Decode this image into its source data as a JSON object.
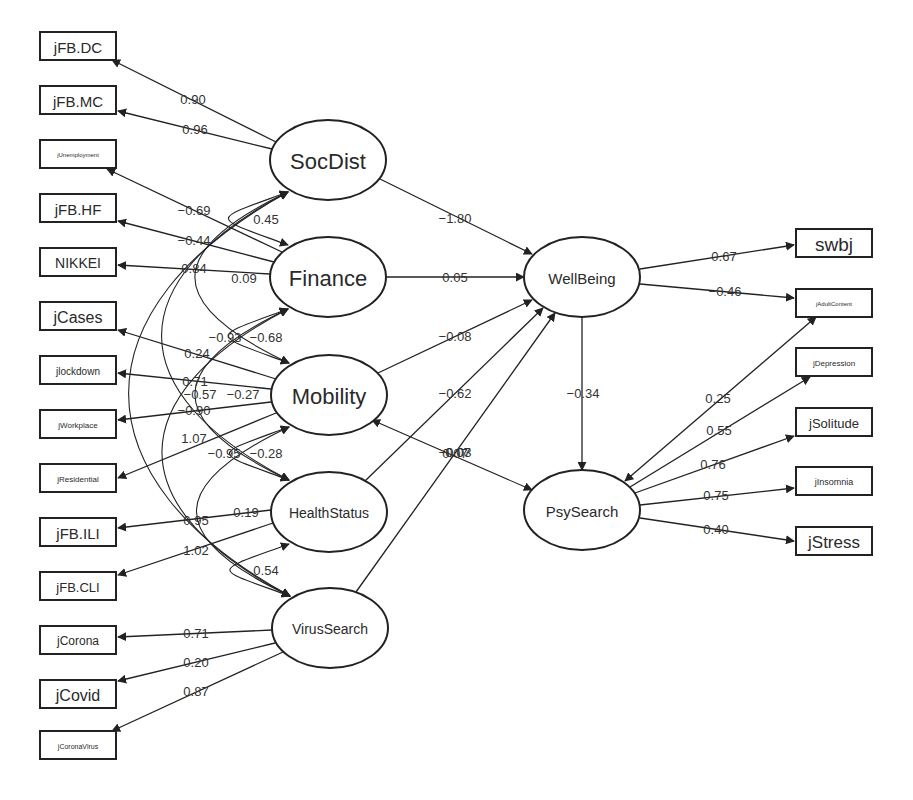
{
  "diagram": {
    "type": "structural-equation-model",
    "line_color": "#222222",
    "background": "#ffffff",
    "latent_variables": [
      {
        "id": "SocDist",
        "label": "SocDist",
        "cx": 328,
        "cy": 160,
        "rx": 58,
        "ry": 40,
        "font_size": 22
      },
      {
        "id": "Finance",
        "label": "Finance",
        "cx": 328,
        "cy": 277,
        "rx": 58,
        "ry": 40,
        "font_size": 22
      },
      {
        "id": "Mobility",
        "label": "Mobility",
        "cx": 329,
        "cy": 395,
        "rx": 58,
        "ry": 40,
        "font_size": 22
      },
      {
        "id": "HealthStatus",
        "label": "HealthStatus",
        "cx": 329,
        "cy": 512,
        "rx": 58,
        "ry": 40,
        "font_size": 14
      },
      {
        "id": "VirusSearch",
        "label": "VirusSearch",
        "cx": 330,
        "cy": 628,
        "rx": 58,
        "ry": 40,
        "font_size": 14
      },
      {
        "id": "WellBeing",
        "label": "WellBeing",
        "cx": 582,
        "cy": 277,
        "rx": 58,
        "ry": 40,
        "font_size": 15
      },
      {
        "id": "PsySearch",
        "label": "PsySearch",
        "cx": 582,
        "cy": 510,
        "rx": 58,
        "ry": 40,
        "font_size": 15
      }
    ],
    "observed_variables": [
      {
        "id": "jFB.DC",
        "label": "jFB.DC",
        "x": 40,
        "y": 32,
        "w": 76,
        "h": 28,
        "font_size": 15
      },
      {
        "id": "jFB.MC",
        "label": "jFB.MC",
        "x": 40,
        "y": 86,
        "w": 76,
        "h": 28,
        "font_size": 15
      },
      {
        "id": "jUnemployment",
        "label": "jUnemployment",
        "x": 40,
        "y": 140,
        "w": 76,
        "h": 28,
        "font_size": 6
      },
      {
        "id": "jFB.HF",
        "label": "jFB.HF",
        "x": 40,
        "y": 194,
        "w": 76,
        "h": 28,
        "font_size": 15
      },
      {
        "id": "NIKKEI",
        "label": "NIKKEI",
        "x": 40,
        "y": 248,
        "w": 76,
        "h": 28,
        "font_size": 14
      },
      {
        "id": "jCases",
        "label": "jCases",
        "x": 40,
        "y": 302,
        "w": 76,
        "h": 28,
        "font_size": 16
      },
      {
        "id": "jlockdown",
        "label": "jlockdown",
        "x": 40,
        "y": 356,
        "w": 76,
        "h": 28,
        "font_size": 10
      },
      {
        "id": "jWorkplace",
        "label": "jWorkplace",
        "x": 40,
        "y": 410,
        "w": 76,
        "h": 28,
        "font_size": 8
      },
      {
        "id": "jResidential",
        "label": "jResidential",
        "x": 40,
        "y": 464,
        "w": 76,
        "h": 28,
        "font_size": 8
      },
      {
        "id": "jFB.ILI",
        "label": "jFB.ILI",
        "x": 40,
        "y": 518,
        "w": 76,
        "h": 28,
        "font_size": 15
      },
      {
        "id": "jFB.CLI",
        "label": "jFB.CLI",
        "x": 40,
        "y": 572,
        "w": 76,
        "h": 28,
        "font_size": 13
      },
      {
        "id": "jCorona",
        "label": "jCorona",
        "x": 40,
        "y": 626,
        "w": 76,
        "h": 28,
        "font_size": 12
      },
      {
        "id": "jCovid",
        "label": "jCovid",
        "x": 40,
        "y": 680,
        "w": 76,
        "h": 28,
        "font_size": 16
      },
      {
        "id": "jCoronaVirus",
        "label": "jCoronaVirus",
        "x": 40,
        "y": 731,
        "w": 76,
        "h": 28,
        "font_size": 7
      },
      {
        "id": "swbj",
        "label": "swbj",
        "x": 796,
        "y": 229,
        "w": 76,
        "h": 28,
        "font_size": 19
      },
      {
        "id": "jAdultContent",
        "label": "jAdultContent",
        "x": 796,
        "y": 289,
        "w": 76,
        "h": 28,
        "font_size": 6
      },
      {
        "id": "jDepression",
        "label": "jDepression",
        "x": 796,
        "y": 348,
        "w": 76,
        "h": 28,
        "font_size": 8
      },
      {
        "id": "jSolitude",
        "label": "jSolitude",
        "x": 796,
        "y": 408,
        "w": 76,
        "h": 28,
        "font_size": 13
      },
      {
        "id": "jInsomnia",
        "label": "jInsomnia",
        "x": 796,
        "y": 467,
        "w": 76,
        "h": 28,
        "font_size": 9
      },
      {
        "id": "jStress",
        "label": "jStress",
        "x": 796,
        "y": 527,
        "w": 76,
        "h": 28,
        "font_size": 17
      }
    ],
    "loadings": [
      {
        "from": "SocDist",
        "to": "jFB.DC",
        "value": "0.90",
        "x1": 276,
        "y1": 142,
        "x2": 112,
        "y2": 60,
        "lx": 193,
        "ly": 99
      },
      {
        "from": "SocDist",
        "to": "jFB.MC",
        "value": "0.96",
        "x1": 272,
        "y1": 149,
        "x2": 118,
        "y2": 111,
        "lx": 195,
        "ly": 129
      },
      {
        "from": "Finance",
        "to": "jUnemployment",
        "value": "−0.69",
        "x1": 282,
        "y1": 252,
        "x2": 107,
        "y2": 169,
        "lx": 194,
        "ly": 210
      },
      {
        "from": "Finance",
        "to": "jFB.HF",
        "value": "−0.44",
        "x1": 274,
        "y1": 262,
        "x2": 118,
        "y2": 221,
        "lx": 194,
        "ly": 240
      },
      {
        "from": "Finance",
        "to": "NIKKEI",
        "value": "0.84",
        "x1": 270,
        "y1": 274,
        "x2": 118,
        "y2": 265,
        "lx": 194,
        "ly": 268
      },
      {
        "from": "Mobility",
        "to": "jCases",
        "value": "0.24",
        "x1": 276,
        "y1": 379,
        "x2": 118,
        "y2": 330,
        "lx": 197,
        "ly": 353
      },
      {
        "from": "Mobility",
        "to": "jlockdown",
        "value": "0.71",
        "x1": 271,
        "y1": 389,
        "x2": 118,
        "y2": 373,
        "lx": 195,
        "ly": 381
      },
      {
        "from": "Mobility",
        "to": "jWorkplace",
        "value": "−0.90",
        "x1": 271,
        "y1": 402,
        "x2": 118,
        "y2": 420,
        "lx": 194,
        "ly": 410
      },
      {
        "from": "Mobility",
        "to": "jResidential",
        "value": "1.07",
        "x1": 276,
        "y1": 413,
        "x2": 118,
        "y2": 478,
        "lx": 194,
        "ly": 438
      },
      {
        "from": "HealthStatus",
        "to": "jFB.ILI",
        "value": "0.95",
        "x1": 271,
        "y1": 510,
        "x2": 118,
        "y2": 528,
        "lx": 196,
        "ly": 520
      },
      {
        "from": "HealthStatus",
        "to": "jFB.CLI",
        "value": "1.02",
        "x1": 273,
        "y1": 523,
        "x2": 118,
        "y2": 575,
        "lx": 196,
        "ly": 550
      },
      {
        "from": "VirusSearch",
        "to": "jCorona",
        "value": "0.71",
        "x1": 272,
        "y1": 630,
        "x2": 118,
        "y2": 637,
        "lx": 196,
        "ly": 633
      },
      {
        "from": "VirusSearch",
        "to": "jCovid",
        "value": "0.20",
        "x1": 275,
        "y1": 643,
        "x2": 118,
        "y2": 681,
        "lx": 196,
        "ly": 662
      },
      {
        "from": "VirusSearch",
        "to": "jCoronaVirus",
        "value": "0.87",
        "x1": 283,
        "y1": 652,
        "x2": 112,
        "y2": 731,
        "lx": 196,
        "ly": 691
      },
      {
        "from": "WellBeing",
        "to": "swbj",
        "value": "0.67",
        "x1": 640,
        "y1": 269,
        "x2": 794,
        "y2": 245,
        "lx": 724,
        "ly": 256
      },
      {
        "from": "WellBeing",
        "to": "jAdultContent",
        "value": "−0.46",
        "x1": 640,
        "y1": 284,
        "x2": 794,
        "y2": 298,
        "lx": 725,
        "ly": 291
      },
      {
        "from": "PsySearch",
        "to": "jDepression",
        "value": "0.55",
        "x1": 630,
        "y1": 487,
        "x2": 810,
        "y2": 377,
        "lx": 719,
        "ly": 430
      },
      {
        "from": "PsySearch",
        "to": "jSolitude",
        "value": "0.76",
        "x1": 635,
        "y1": 493,
        "x2": 794,
        "y2": 436,
        "lx": 713,
        "ly": 464
      },
      {
        "from": "PsySearch",
        "to": "jInsomnia",
        "value": "0.75",
        "x1": 640,
        "y1": 505,
        "x2": 794,
        "y2": 488,
        "lx": 716,
        "ly": 495
      },
      {
        "from": "PsySearch",
        "to": "jStress",
        "value": "0.40",
        "x1": 640,
        "y1": 518,
        "x2": 794,
        "y2": 541,
        "lx": 716,
        "ly": 529
      }
    ],
    "structural_paths": [
      {
        "from": "SocDist",
        "to": "WellBeing",
        "value": "−1.80",
        "x1": 378,
        "y1": 178,
        "x2": 532,
        "y2": 254,
        "lx": 455,
        "ly": 218
      },
      {
        "from": "Finance",
        "to": "WellBeing",
        "value": "0.05",
        "x1": 386,
        "y1": 277,
        "x2": 524,
        "y2": 277,
        "lx": 455,
        "ly": 277
      },
      {
        "from": "Mobility",
        "to": "WellBeing",
        "value": "−0.08",
        "x1": 378,
        "y1": 373,
        "x2": 532,
        "y2": 300,
        "lx": 455,
        "ly": 336
      },
      {
        "from": "HealthStatus",
        "to": "WellBeing",
        "value": "−0.62",
        "x1": 365,
        "y1": 481,
        "x2": 543,
        "y2": 308,
        "lx": 455,
        "ly": 393
      },
      {
        "from": "VirusSearch",
        "to": "WellBeing",
        "value": "0.07",
        "x1": 356,
        "y1": 592,
        "x2": 555,
        "y2": 313,
        "lx": 455,
        "ly": 453
      },
      {
        "from": "WellBeing",
        "to": "PsySearch",
        "value": "−0.34",
        "x1": 582,
        "y1": 317,
        "x2": 582,
        "y2": 470,
        "lx": 583,
        "ly": 393
      },
      {
        "from": "PsySearch",
        "to": "jAdultContent",
        "value": "0.25",
        "x1": 625,
        "y1": 481,
        "x2": 816,
        "y2": 317,
        "lx": 718,
        "ly": 398,
        "bidirectional": true
      }
    ],
    "covariances": [
      {
        "from": "SocDist",
        "to": "Finance",
        "value": "0.45",
        "lx": 266,
        "ly": 219
      },
      {
        "from": "SocDist",
        "to": "Mobility",
        "value": "0.09",
        "lx": 244,
        "ly": 278
      },
      {
        "from": "SocDist",
        "to": "HealthStatus",
        "value": "−0.93",
        "lx": 225,
        "ly": 337
      },
      {
        "from": "SocDist",
        "to": "VirusSearch",
        "value": "−0.57",
        "lx": 200,
        "ly": 394
      },
      {
        "from": "Finance",
        "to": "Mobility",
        "value": "−0.68",
        "lx": 266,
        "ly": 337
      },
      {
        "from": "Finance",
        "to": "HealthStatus",
        "value": "−0.27",
        "lx": 243,
        "ly": 394
      },
      {
        "from": "Finance",
        "to": "VirusSearch",
        "value": "−0.95",
        "lx": 224,
        "ly": 453
      },
      {
        "from": "Mobility",
        "to": "HealthStatus",
        "value": "−0.28",
        "lx": 266,
        "ly": 453
      },
      {
        "from": "Mobility",
        "to": "VirusSearch",
        "value": "0.19",
        "lx": 246,
        "ly": 512
      },
      {
        "from": "HealthStatus",
        "to": "VirusSearch",
        "value": "0.54",
        "lx": 266,
        "ly": 570
      },
      {
        "from": "Mobility",
        "to": "PsySearch",
        "value": "−0.03",
        "value_overlap": "0.07",
        "lx": 455,
        "ly": 452,
        "x1": 372,
        "y1": 420,
        "x2": 532,
        "y2": 490
      }
    ]
  }
}
